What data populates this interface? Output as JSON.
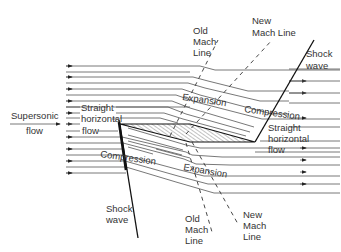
{
  "diagram": {
    "colors": {
      "line": "#555555",
      "text": "#333333",
      "shock": "#111111",
      "hatch": "#666666",
      "background": "#ffffff"
    },
    "labels": {
      "supersonic_flow_1": "Supersonic",
      "supersonic_flow_2": "flow",
      "straight_left_1": "Straight",
      "straight_left_2": "horizontal",
      "straight_left_3": "flow",
      "straight_right_1": "Straight",
      "straight_right_2": "horizontal",
      "straight_right_3": "flow",
      "expansion_top": "Expansion",
      "expansion_bottom": "Expansion",
      "compression_top": "Compression",
      "compression_bottom": "Compression",
      "shock_top_1": "Shock",
      "shock_top_2": "wave",
      "shock_bottom_1": "Shock",
      "shock_bottom_2": "wave",
      "old_mach_top_1": "Old",
      "old_mach_top_2": "Mach",
      "old_mach_top_3": "Line",
      "new_mach_top_1": "New",
      "new_mach_top_2": "Mach Line",
      "old_mach_bottom_1": "Old",
      "old_mach_bottom_2": "Mach",
      "old_mach_bottom_3": "Line",
      "new_mach_bottom_1": "New",
      "new_mach_bottom_2": "Mach",
      "new_mach_bottom_3": "Line"
    },
    "elements": {
      "airfoil": {
        "shape": "hatched sliver",
        "points": [
          [
            118,
            124
          ],
          [
            190,
            124
          ],
          [
            255,
            141
          ],
          [
            118,
            128
          ]
        ]
      },
      "shock_top": {
        "from": [
          255,
          141
        ],
        "to": [
          314,
          40
        ]
      },
      "shock_bottom": {
        "from": [
          117,
          122
        ],
        "to": [
          137,
          237
        ]
      },
      "old_mach_top": {
        "from": [
          170,
          138
        ],
        "to": [
          218,
          40
        ]
      },
      "new_mach_top": {
        "from": [
          191,
          124
        ],
        "to": [
          272,
          40
        ]
      },
      "old_mach_bottom": {
        "from": [
          187,
          145
        ],
        "to": [
          214,
          230
        ]
      },
      "new_mach_bottom": {
        "from": [
          193,
          143
        ],
        "to": [
          240,
          222
        ]
      }
    }
  }
}
